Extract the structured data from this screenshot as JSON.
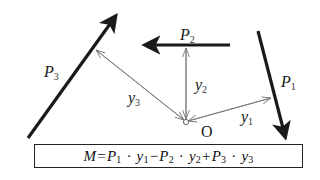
{
  "diagram": {
    "forces": [
      {
        "name": "P",
        "sub": "1",
        "direction": "down-right"
      },
      {
        "name": "P",
        "sub": "2",
        "direction": "left"
      },
      {
        "name": "P",
        "sub": "3",
        "direction": "up-right"
      }
    ],
    "arms": [
      {
        "name": "y",
        "sub": "1"
      },
      {
        "name": "y",
        "sub": "2"
      },
      {
        "name": "y",
        "sub": "3"
      }
    ],
    "origin_label": "O",
    "colors": {
      "force": "#1a1a1a",
      "arm": "#777777",
      "background": "#ffffff"
    }
  },
  "formula": {
    "lhs": "M",
    "eq": "=",
    "terms": [
      {
        "sign": "",
        "P": "P",
        "Psub": "1",
        "dot": "·",
        "y": "y",
        "ysub": "1"
      },
      {
        "sign": "−",
        "P": "P",
        "Psub": "2",
        "dot": "·",
        "y": "y",
        "ysub": "2"
      },
      {
        "sign": "+",
        "P": "P",
        "Psub": "3",
        "dot": "·",
        "y": "y",
        "ysub": "3"
      }
    ]
  }
}
